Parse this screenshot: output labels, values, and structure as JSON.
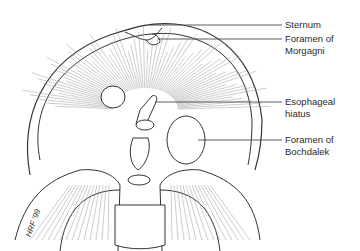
{
  "figure": {
    "type": "anatomical-illustration",
    "labels": [
      {
        "id": "sternum",
        "text": "Sternum"
      },
      {
        "id": "foramen-morgagni",
        "text": "Foramen of\nMorgagni"
      },
      {
        "id": "esophageal-hiatus",
        "text": "Esophageal\nhiatus"
      },
      {
        "id": "foramen-bochdalek",
        "text": "Foramen of\nBochdalek"
      }
    ],
    "signature": "HRF '99"
  }
}
